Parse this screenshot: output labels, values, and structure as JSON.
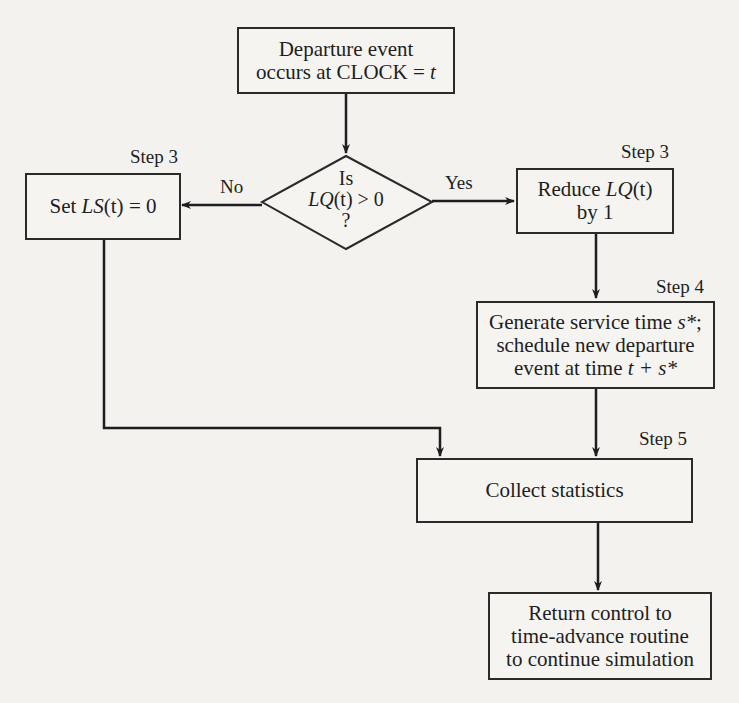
{
  "nodes": {
    "start": {
      "line1": "Departure event",
      "line2_prefix": "occurs at CLOCK = ",
      "line2_var": "t"
    },
    "decision": {
      "line1": "Is",
      "expr_var": "LQ",
      "expr_arg": "(t)",
      "expr_rest": " > 0",
      "line3": "?"
    },
    "set_ls": {
      "prefix": "Set ",
      "var": "LS",
      "arg": "(t)",
      "rest": " = 0",
      "step": "Step 3"
    },
    "reduce_lq": {
      "prefix": "Reduce ",
      "var": "LQ",
      "arg": "(t)",
      "line2": "by 1",
      "step": "Step 3"
    },
    "generate": {
      "line1_prefix": "Generate service time ",
      "line1_var": "s*",
      "line1_suffix": ";",
      "line2": "schedule new departure",
      "line3_prefix": "event at time ",
      "line3_var": "t + s*",
      "step": "Step 4"
    },
    "collect": {
      "label": "Collect statistics",
      "step": "Step 5"
    },
    "return": {
      "line1": "Return control to",
      "line2": "time-advance routine",
      "line3": "to continue simulation"
    }
  },
  "edges": {
    "no_label": "No",
    "yes_label": "Yes"
  },
  "colors": {
    "line": "#1e1e1e",
    "background": "#f3f2ef"
  }
}
